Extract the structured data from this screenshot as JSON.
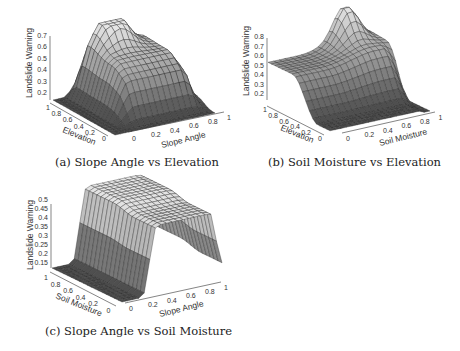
{
  "chart_data": [
    {
      "type": "surface3d",
      "id": "a",
      "caption": "(a) Slope Angle vs Elevation",
      "xlabel": "Slope Angle",
      "ylabel": "Elevation",
      "zlabel": "Landslide Warning",
      "x_ticks": [
        "0",
        "0.2",
        "0.4",
        "0.6",
        "0.8",
        "1"
      ],
      "y_ticks": [
        "0",
        "0.2",
        "0.4",
        "0.6",
        "0.8",
        "1"
      ],
      "z_ticks": [
        "0.2",
        "0.3",
        "0.4",
        "0.5",
        "0.6",
        "0.7"
      ],
      "zlim": [
        0.15,
        0.75
      ],
      "description": "Plateau rising with both inputs; peak ~0.75 near slope angle 0.4-0.6, elevation 0.8-1; low ~0.15 near edges",
      "grid": true
    },
    {
      "type": "surface3d",
      "id": "b",
      "caption": "(b) Soil Moisture vs Elevation",
      "xlabel": "Soil Moisture",
      "ylabel": "Elevation",
      "zlabel": "Landslide Warning",
      "x_ticks": [
        "0",
        "0.2",
        "0.4",
        "0.6",
        "0.8",
        "1"
      ],
      "y_ticks": [
        "0",
        "0.2",
        "0.4",
        "0.6",
        "0.8",
        "1"
      ],
      "z_ticks": [
        "0.2",
        "0.3",
        "0.4",
        "0.5",
        "0.6",
        "0.7",
        "0.8"
      ],
      "zlim": [
        0.15,
        0.85
      ],
      "description": "Broad plateau ~0.5 at high elevation, sharp peak ~0.85 at high soil moisture and high elevation; low ~0.15 at low elevation",
      "grid": true
    },
    {
      "type": "surface3d",
      "id": "c",
      "caption": "(c) Slope Angle vs Soil Moisture",
      "xlabel": "Slope Angle",
      "ylabel": "Soil Moisture",
      "zlabel": "Landslide Warning",
      "x_ticks": [
        "0",
        "0.2",
        "0.4",
        "0.6",
        "0.8",
        "1"
      ],
      "y_ticks": [
        "0",
        "0.2",
        "0.4",
        "0.6",
        "0.8",
        "1"
      ],
      "z_ticks": [
        "0.15",
        "0.2",
        "0.25",
        "0.3",
        "0.35",
        "0.4",
        "0.45",
        "0.5"
      ],
      "zlim": [
        0.13,
        0.5
      ],
      "description": "Steep wall rising from ~0.13 at low slope angle to plateau ~0.5 for slope angle 0.3-0.9; drops near slope angle 1",
      "grid": true
    }
  ],
  "captions": {
    "a": "(a) Slope Angle vs Elevation",
    "b": "(b) Soil Moisture vs Elevation",
    "c": "(c) Slope Angle vs Soil Moisture"
  },
  "axes": {
    "z_label": "Landslide Warning",
    "a": {
      "x": "Slope Angle",
      "y": "Elevation"
    },
    "b": {
      "x": "Soil Moisture",
      "y": "Elevation"
    },
    "c": {
      "x": "Slope Angle",
      "y": "Soil Moisture"
    }
  },
  "ticks": {
    "xy": [
      "0",
      "0.2",
      "0.4",
      "0.6",
      "0.8",
      "1"
    ],
    "za": [
      "0.2",
      "0.3",
      "0.4",
      "0.5",
      "0.6",
      "0.7"
    ],
    "zb": [
      "0.2",
      "0.3",
      "0.4",
      "0.5",
      "0.6",
      "0.7",
      "0.8"
    ],
    "zc": [
      "0.15",
      "0.2",
      "0.25",
      "0.3",
      "0.35",
      "0.4",
      "0.45",
      "0.5"
    ]
  }
}
